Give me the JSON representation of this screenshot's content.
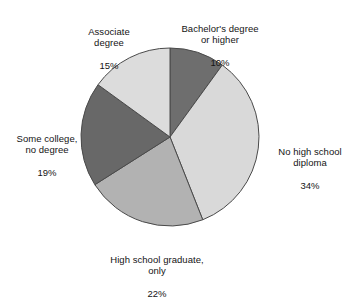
{
  "chart_data": {
    "type": "pie",
    "title": "",
    "subtitle": "",
    "xlabel": "",
    "ylabel": "",
    "legend_position": "none",
    "grid": false,
    "start_angle_deg": 0,
    "direction": "clockwise",
    "categories": [
      "Bachelor's degree or higher",
      "No high school diploma",
      "High school graduate, only",
      "Some college, no degree",
      "Associate degree"
    ],
    "values": [
      10,
      34,
      22,
      19,
      15
    ],
    "value_unit": "%",
    "colors": [
      "#6e6e6e",
      "#d9d9d9",
      "#b2b2b2",
      "#686868",
      "#dcdcdc"
    ],
    "slices": [
      {
        "name": "Bachelor's degree or higher",
        "label_line1": "Bachelor's degree",
        "label_line2": "or higher",
        "label_text": "Bachelor's degree\nor higher",
        "value": 10,
        "percent_label": "10%",
        "color": "#6e6e6e",
        "start_deg": 0,
        "end_deg": 36
      },
      {
        "name": "No high school diploma",
        "label_line1": "No high school",
        "label_line2": "diploma",
        "label_text": "No high school\ndiploma",
        "value": 34,
        "percent_label": "34%",
        "color": "#d9d9d9",
        "start_deg": 36,
        "end_deg": 158.4
      },
      {
        "name": "High school graduate, only",
        "label_line1": "High school graduate,",
        "label_line2": "only",
        "label_text": "High school graduate,\nonly",
        "value": 22,
        "percent_label": "22%",
        "color": "#b2b2b2",
        "start_deg": 158.4,
        "end_deg": 237.6
      },
      {
        "name": "Some college, no degree",
        "label_line1": "Some college,",
        "label_line2": "no degree",
        "label_text": "Some college,\nno degree",
        "value": 19,
        "percent_label": "19%",
        "color": "#686868",
        "start_deg": 237.6,
        "end_deg": 306
      },
      {
        "name": "Associate degree",
        "label_line1": "Associate",
        "label_line2": "degree",
        "label_text": "Associate\ndegree",
        "value": 15,
        "percent_label": "15%",
        "color": "#dcdcdc",
        "start_deg": 306,
        "end_deg": 360
      }
    ]
  },
  "geometry": {
    "center_x": 170,
    "center_y": 137,
    "radius": 89,
    "stroke_color": "#4a4a4a",
    "stroke_width": 1
  }
}
